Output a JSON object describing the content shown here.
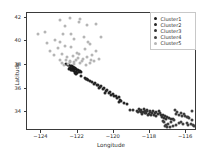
{
  "chart_data": {
    "type": "scatter",
    "title": "",
    "xlabel": "Longitude",
    "ylabel": "Latitude",
    "xlim": [
      -124.8,
      -115.4
    ],
    "ylim": [
      32.4,
      42.4
    ],
    "xticks": [
      -124,
      -122,
      -120,
      -118,
      -116
    ],
    "yticks": [
      34,
      36,
      38,
      40,
      42
    ],
    "grid": false,
    "legend_position": "upper right",
    "marker_size_px": 3.0,
    "series": [
      {
        "name": "Cluster1",
        "color": "#1c1c1c",
        "points": [
          [
            -122.28,
            37.85
          ],
          [
            -122.25,
            37.8
          ],
          [
            -122.22,
            37.78
          ],
          [
            -122.19,
            37.74
          ],
          [
            -122.3,
            37.88
          ],
          [
            -122.26,
            37.72
          ],
          [
            -122.2,
            37.66
          ],
          [
            -122.15,
            37.7
          ],
          [
            -122.4,
            37.76
          ],
          [
            -122.44,
            37.74
          ],
          [
            -122.12,
            37.68
          ],
          [
            -122.08,
            37.64
          ],
          [
            -122.05,
            37.58
          ],
          [
            -121.98,
            37.55
          ],
          [
            -121.93,
            37.52
          ],
          [
            -121.88,
            37.48
          ],
          [
            -122.33,
            37.62
          ],
          [
            -122.29,
            37.58
          ],
          [
            -122.24,
            37.54
          ],
          [
            -122.18,
            37.5
          ],
          [
            -122.35,
            37.93
          ],
          [
            -122.1,
            37.44
          ],
          [
            -121.95,
            37.38
          ],
          [
            -122.02,
            37.34
          ],
          [
            -122.46,
            37.68
          ],
          [
            -122.38,
            37.56
          ],
          [
            -122.16,
            37.3
          ],
          [
            -122.07,
            37.26
          ],
          [
            -122.48,
            38.0
          ],
          [
            -122.55,
            37.96
          ],
          [
            -122.62,
            38.1
          ],
          [
            -121.82,
            37.42
          ]
        ]
      },
      {
        "name": "Cluster2",
        "color": "#262626",
        "points": [
          [
            -121.3,
            36.62
          ],
          [
            -121.05,
            36.48
          ],
          [
            -120.88,
            36.34
          ],
          [
            -120.7,
            36.2
          ],
          [
            -120.52,
            36.06
          ],
          [
            -120.38,
            35.88
          ],
          [
            -120.2,
            35.7
          ],
          [
            -121.48,
            36.78
          ],
          [
            -121.62,
            36.9
          ],
          [
            -121.8,
            37.04
          ],
          [
            -120.05,
            35.52
          ],
          [
            -119.9,
            35.4
          ],
          [
            -119.74,
            35.28
          ],
          [
            -121.18,
            36.52
          ],
          [
            -120.95,
            36.28
          ],
          [
            -120.6,
            35.98
          ],
          [
            -120.42,
            35.76
          ],
          [
            -119.82,
            35.18
          ],
          [
            -119.66,
            35.06
          ],
          [
            -121.4,
            36.7
          ],
          [
            -120.78,
            36.12
          ],
          [
            -120.28,
            35.6
          ],
          [
            -119.98,
            35.34
          ],
          [
            -119.58,
            34.98
          ],
          [
            -121.12,
            36.4
          ],
          [
            -120.84,
            36.02
          ],
          [
            -120.48,
            35.64
          ],
          [
            -119.7,
            34.88
          ],
          [
            -121.55,
            36.82
          ],
          [
            -120.14,
            35.44
          ],
          [
            -119.44,
            34.8
          ],
          [
            -119.26,
            34.72
          ]
        ]
      },
      {
        "name": "Cluster3",
        "color": "#333333",
        "points": [
          [
            -119.1,
            34.22
          ],
          [
            -118.92,
            34.18
          ],
          [
            -118.74,
            34.12
          ],
          [
            -118.56,
            34.08
          ],
          [
            -118.4,
            34.04
          ],
          [
            -118.26,
            34.1
          ],
          [
            -118.14,
            34.06
          ],
          [
            -118.02,
            34.0
          ],
          [
            -117.88,
            33.96
          ],
          [
            -117.72,
            33.9
          ],
          [
            -117.56,
            33.84
          ],
          [
            -117.4,
            33.78
          ],
          [
            -118.34,
            34.24
          ],
          [
            -118.48,
            34.2
          ],
          [
            -118.62,
            34.26
          ],
          [
            -118.2,
            33.9
          ],
          [
            -118.06,
            33.84
          ],
          [
            -117.92,
            33.78
          ],
          [
            -117.78,
            33.72
          ],
          [
            -117.64,
            33.66
          ],
          [
            -118.3,
            33.96
          ],
          [
            -118.16,
            34.16
          ],
          [
            -117.98,
            34.12
          ],
          [
            -117.84,
            34.08
          ],
          [
            -117.3,
            33.72
          ],
          [
            -117.18,
            33.66
          ],
          [
            -117.06,
            33.6
          ],
          [
            -116.94,
            33.54
          ],
          [
            -118.44,
            33.88
          ],
          [
            -118.12,
            33.76
          ],
          [
            -117.66,
            34.02
          ],
          [
            -117.5,
            34.06
          ],
          [
            -118.66,
            34.02
          ],
          [
            -117.44,
            33.92
          ],
          [
            -117.24,
            33.48
          ],
          [
            -116.82,
            33.42
          ],
          [
            -118.52,
            33.98
          ],
          [
            -117.36,
            33.58
          ],
          [
            -117.12,
            33.44
          ],
          [
            -116.7,
            33.38
          ]
        ]
      },
      {
        "name": "Cluster4",
        "color": "#404040",
        "points": [
          [
            -116.55,
            33.8
          ],
          [
            -116.38,
            33.74
          ],
          [
            -116.22,
            33.7
          ],
          [
            -116.06,
            33.66
          ],
          [
            -115.9,
            33.62
          ],
          [
            -116.48,
            34.02
          ],
          [
            -116.3,
            33.92
          ],
          [
            -116.14,
            33.86
          ],
          [
            -115.98,
            33.56
          ],
          [
            -115.82,
            33.5
          ],
          [
            -115.66,
            34.1
          ],
          [
            -116.62,
            34.14
          ],
          [
            -115.74,
            32.96
          ],
          [
            -115.62,
            32.9
          ],
          [
            -115.54,
            32.84
          ],
          [
            -115.88,
            32.88
          ],
          [
            -116.9,
            32.78
          ],
          [
            -117.08,
            32.72
          ],
          [
            -117.16,
            32.82
          ],
          [
            -116.74,
            32.86
          ],
          [
            -116.58,
            32.92
          ],
          [
            -116.42,
            33.04
          ],
          [
            -117.22,
            33.14
          ],
          [
            -117.3,
            33.22
          ],
          [
            -116.98,
            33.0
          ],
          [
            -116.66,
            33.3
          ],
          [
            -116.26,
            33.18
          ],
          [
            -115.96,
            33.12
          ],
          [
            -117.12,
            32.94
          ],
          [
            -116.84,
            33.16
          ],
          [
            -116.18,
            32.98
          ],
          [
            -115.7,
            33.34
          ]
        ]
      },
      {
        "name": "Cluster5",
        "color": "#b5b5b5",
        "points": [
          [
            -124.2,
            40.58
          ],
          [
            -123.8,
            40.8
          ],
          [
            -122.95,
            41.78
          ],
          [
            -122.4,
            41.94
          ],
          [
            -121.85,
            41.92
          ],
          [
            -121.5,
            41.4
          ],
          [
            -122.7,
            41.32
          ],
          [
            -123.25,
            40.12
          ],
          [
            -122.8,
            40.58
          ],
          [
            -122.38,
            40.6
          ],
          [
            -121.95,
            41.6
          ],
          [
            -120.98,
            41.48
          ],
          [
            -123.55,
            39.18
          ],
          [
            -123.1,
            39.44
          ],
          [
            -122.72,
            39.62
          ],
          [
            -122.34,
            39.56
          ],
          [
            -123.32,
            38.84
          ],
          [
            -122.88,
            38.92
          ],
          [
            -122.58,
            38.66
          ],
          [
            -122.26,
            38.74
          ],
          [
            -121.9,
            38.96
          ],
          [
            -121.62,
            39.32
          ],
          [
            -121.3,
            39.74
          ],
          [
            -120.96,
            39.18
          ],
          [
            -122.96,
            38.44
          ],
          [
            -122.64,
            38.38
          ],
          [
            -122.44,
            38.28
          ],
          [
            -122.18,
            38.24
          ],
          [
            -121.98,
            38.58
          ],
          [
            -121.72,
            38.52
          ],
          [
            -121.48,
            38.7
          ],
          [
            -121.26,
            38.44
          ],
          [
            -122.84,
            38.2
          ],
          [
            -122.52,
            38.12
          ],
          [
            -122.22,
            38.06
          ],
          [
            -121.88,
            38.18
          ],
          [
            -121.56,
            38.02
          ],
          [
            -121.32,
            38.14
          ],
          [
            -121.08,
            38.36
          ],
          [
            -120.84,
            38.52
          ],
          [
            -122.74,
            37.98
          ],
          [
            -122.42,
            38.36
          ],
          [
            -122.1,
            38.42
          ],
          [
            -121.78,
            38.34
          ],
          [
            -123.0,
            39.96
          ],
          [
            -122.2,
            40.2
          ],
          [
            -121.66,
            40.4
          ],
          [
            -120.7,
            40.4
          ],
          [
            -123.68,
            39.82
          ],
          [
            -121.44,
            39.96
          ],
          [
            -122.06,
            39.02
          ],
          [
            -121.18,
            38.86
          ]
        ]
      }
    ]
  },
  "legend": {
    "entries": [
      {
        "label": "Cluster1"
      },
      {
        "label": "Cluster2"
      },
      {
        "label": "Cluster3"
      },
      {
        "label": "Cluster4"
      },
      {
        "label": "Cluster5"
      }
    ]
  }
}
